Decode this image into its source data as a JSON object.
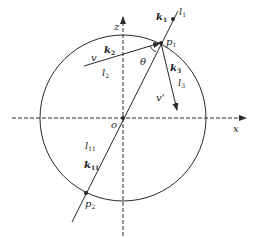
{
  "diagram": {
    "type": "geometry-physics",
    "colors": {
      "stroke": "#2a2a2a",
      "background": "#ffffff"
    },
    "axes": {
      "x_label": "x",
      "z_label": "z",
      "origin_label": "o"
    },
    "points": {
      "p1": {
        "label": "p",
        "sub": "1"
      },
      "p2": {
        "label": "p",
        "sub": "2"
      }
    },
    "labels": {
      "k1": {
        "label": "k",
        "sub": "1"
      },
      "l1": {
        "label": "l",
        "sub": "1"
      },
      "k2": {
        "label": "k",
        "sub": "2"
      },
      "l2": {
        "label": "l",
        "sub": "2"
      },
      "v": "v",
      "theta": "θ",
      "k3": {
        "label": "k",
        "sub": "3"
      },
      "l3": {
        "label": "l",
        "sub": "3"
      },
      "v_prime": "v'",
      "l11": {
        "label": "l",
        "sub": "11"
      },
      "k11": {
        "label": "k",
        "sub": "11"
      }
    }
  }
}
